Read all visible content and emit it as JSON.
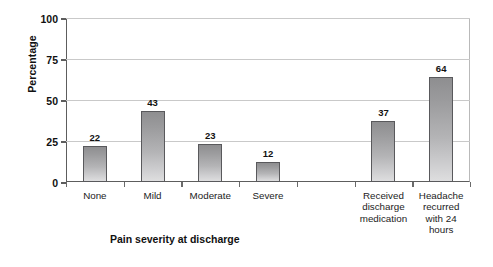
{
  "chart_data": {
    "type": "bar",
    "title": "",
    "subtitle": "",
    "xlabel": "Pain severity at discharge",
    "ylabel": "Percentage",
    "categories": [
      "None",
      "Mild",
      "Moderate",
      "Severe",
      "",
      "Received discharge medication",
      "Headache recurred with 24 hours"
    ],
    "category_labels_wrapped": [
      "None",
      "Mild",
      "Moderate",
      "Severe",
      "",
      "Received\ndischarge\nmedication",
      "Headache\nrecurred\nwith 24\nhours"
    ],
    "values": [
      22,
      43,
      23,
      12,
      null,
      37,
      64
    ],
    "value_labels": [
      "22",
      "43",
      "23",
      "12",
      "",
      "37",
      "64"
    ],
    "ylim": [
      0,
      100
    ],
    "yticks": [
      0,
      25,
      50,
      75,
      100
    ],
    "ytick_labels": [
      "0",
      "25",
      "50",
      "75",
      "100"
    ],
    "grid": true,
    "grid_axis": "y",
    "legend": false,
    "legend_position": "none",
    "bar_color_top": "#8e8e90",
    "bar_color_bottom": "#dededf",
    "bar_border_color": "#59595c",
    "axis_color": "#5d5d5d",
    "gridline_color": "#c9c9c9",
    "background_color": "#ffffff",
    "text_color": "#111111"
  }
}
